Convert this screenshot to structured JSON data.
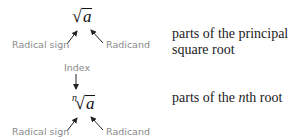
{
  "square_root": {
    "radical_symbol": "√",
    "radicand_var": "a",
    "label_radical_sign": "Radical sign",
    "label_radicand": "Radicand",
    "description": "parts of the principal square root"
  },
  "nth_root": {
    "radical_symbol": "√",
    "radicand_var": "a",
    "index_var": "n",
    "label_index": "Index",
    "label_radical_sign": "Radical sign",
    "label_radicand": "Radicand",
    "description_prefix": "parts of the ",
    "description_italic": "n",
    "description_suffix": "th root"
  }
}
